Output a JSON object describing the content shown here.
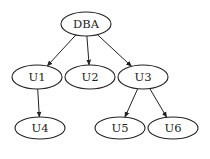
{
  "diagram": {
    "type": "tree",
    "nodes": [
      {
        "id": "DBA",
        "label": "DBA",
        "cx": 86,
        "cy": 24,
        "rx": 25,
        "ry": 12
      },
      {
        "id": "U1",
        "label": "U1",
        "cx": 37,
        "cy": 77,
        "rx": 25,
        "ry": 12
      },
      {
        "id": "U2",
        "label": "U2",
        "cx": 90,
        "cy": 77,
        "rx": 25,
        "ry": 12
      },
      {
        "id": "U3",
        "label": "U3",
        "cx": 143,
        "cy": 77,
        "rx": 25,
        "ry": 12
      },
      {
        "id": "U4",
        "label": "U4",
        "cx": 40,
        "cy": 128,
        "rx": 25,
        "ry": 11
      },
      {
        "id": "U5",
        "label": "U5",
        "cx": 120,
        "cy": 128,
        "rx": 25,
        "ry": 11
      },
      {
        "id": "U6",
        "label": "U6",
        "cx": 173,
        "cy": 128,
        "rx": 25,
        "ry": 11
      }
    ],
    "edges": [
      {
        "from": "DBA",
        "to": "U1"
      },
      {
        "from": "DBA",
        "to": "U2"
      },
      {
        "from": "DBA",
        "to": "U3"
      },
      {
        "from": "U1",
        "to": "U4"
      },
      {
        "from": "U3",
        "to": "U5"
      },
      {
        "from": "U3",
        "to": "U6"
      }
    ]
  }
}
